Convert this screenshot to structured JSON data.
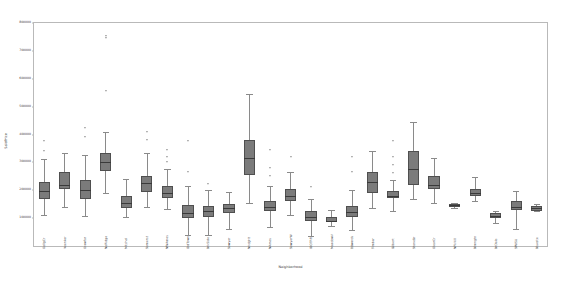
{
  "chart_data": {
    "type": "box",
    "title": "",
    "xlabel": "Neighborhood",
    "ylabel": "SalePrice",
    "ylim": [
      0,
      800000
    ],
    "ytick_labels": [
      "100000",
      "200000",
      "300000",
      "400000",
      "500000",
      "600000",
      "700000",
      "800000"
    ],
    "ytick_values": [
      100000,
      200000,
      300000,
      400000,
      500000,
      600000,
      700000,
      800000
    ],
    "grid": false,
    "legend": false,
    "box_fill_color": "#7b7b7b",
    "median_color": "#3a3a3a",
    "whisker_color": "#8a8a8a",
    "flier_color": "#4a4a4a",
    "categories": [
      "CollgCr",
      "Veenker",
      "Crawfor",
      "NoRidge",
      "Mitchel",
      "Somerst",
      "NWAmes",
      "OldTown",
      "BrkSide",
      "Sawyer",
      "NridgHt",
      "NAmes",
      "SawyerW",
      "IDOTRR",
      "MeadowV",
      "Edwards",
      "Timber",
      "Gilbert",
      "StoneBr",
      "ClearCr",
      "NPkVill",
      "Blmngtn",
      "BrDale",
      "SWISU",
      "Blueste"
    ],
    "boxes": [
      {
        "name": "CollgCr",
        "q1": 170000,
        "median": 197200,
        "q3": 228000,
        "whisker_low": 110000,
        "whisker_high": 312000,
        "fliers": [
          340000,
          375000
        ]
      },
      {
        "name": "Veenker",
        "q1": 205000,
        "median": 218000,
        "q3": 265000,
        "whisker_low": 139000,
        "whisker_high": 335000,
        "fliers": []
      },
      {
        "name": "Crawfor",
        "q1": 168000,
        "median": 200600,
        "q3": 238000,
        "whisker_low": 107000,
        "whisker_high": 325000,
        "fliers": [
          392500,
          422000
        ]
      },
      {
        "name": "NoRidge",
        "q1": 270000,
        "median": 301500,
        "q3": 335000,
        "whisker_low": 190000,
        "whisker_high": 410000,
        "fliers": [
          555000,
          745000,
          755000
        ]
      },
      {
        "name": "Mitchel",
        "q1": 135000,
        "median": 153500,
        "q3": 180000,
        "whisker_low": 104000,
        "whisker_high": 240000,
        "fliers": []
      },
      {
        "name": "Somerst",
        "q1": 192000,
        "median": 225500,
        "q3": 250000,
        "whisker_low": 139000,
        "whisker_high": 335000,
        "fliers": [
          380000,
          410000
        ]
      },
      {
        "name": "NWAmes",
        "q1": 172000,
        "median": 190000,
        "q3": 215000,
        "whisker_low": 132000,
        "whisker_high": 278000,
        "fliers": [
          300000,
          320000,
          345000
        ]
      },
      {
        "name": "OldTown",
        "q1": 100000,
        "median": 119000,
        "q3": 147000,
        "whisker_low": 40000,
        "whisker_high": 215000,
        "fliers": [
          265000,
          375000
        ]
      },
      {
        "name": "BrkSide",
        "q1": 105000,
        "median": 124300,
        "q3": 145000,
        "whisker_low": 40000,
        "whisker_high": 200000,
        "fliers": [
          224000
        ]
      },
      {
        "name": "Sawyer",
        "q1": 120000,
        "median": 135000,
        "q3": 150000,
        "whisker_low": 62000,
        "whisker_high": 192000,
        "fliers": []
      },
      {
        "name": "NridgHt",
        "q1": 255000,
        "median": 315000,
        "q3": 380000,
        "whisker_low": 155000,
        "whisker_high": 545000,
        "fliers": []
      },
      {
        "name": "NAmes",
        "q1": 125000,
        "median": 140000,
        "q3": 162000,
        "whisker_low": 68000,
        "whisker_high": 215000,
        "fliers": [
          252000,
          280000,
          345000
        ]
      },
      {
        "name": "SawyerW",
        "q1": 160000,
        "median": 179900,
        "q3": 205000,
        "whisker_low": 110000,
        "whisker_high": 265000,
        "fliers": [
          320000
        ]
      },
      {
        "name": "IDOTRR",
        "q1": 88000,
        "median": 103000,
        "q3": 125000,
        "whisker_low": 34900,
        "whisker_high": 170000,
        "fliers": [
          212000
        ]
      },
      {
        "name": "MeadowV",
        "q1": 85000,
        "median": 88000,
        "q3": 105000,
        "whisker_low": 73000,
        "whisker_high": 130000,
        "fliers": []
      },
      {
        "name": "Edwards",
        "q1": 103000,
        "median": 121750,
        "q3": 145000,
        "whisker_low": 58500,
        "whisker_high": 200000,
        "fliers": [
          265000,
          320000
        ]
      },
      {
        "name": "Timber",
        "q1": 190000,
        "median": 228475,
        "q3": 265000,
        "whisker_low": 138000,
        "whisker_high": 340000,
        "fliers": []
      },
      {
        "name": "Gilbert",
        "q1": 172000,
        "median": 181000,
        "q3": 198000,
        "whisker_low": 125000,
        "whisker_high": 238000,
        "fliers": [
          262000,
          290000,
          320000,
          377500
        ]
      },
      {
        "name": "StoneBr",
        "q1": 220000,
        "median": 278000,
        "q3": 340000,
        "whisker_low": 170000,
        "whisker_high": 445000,
        "fliers": []
      },
      {
        "name": "ClearCr",
        "q1": 205000,
        "median": 220000,
        "q3": 250000,
        "whisker_low": 155000,
        "whisker_high": 315000,
        "fliers": []
      },
      {
        "name": "NPkVill",
        "q1": 140000,
        "median": 146000,
        "q3": 152000,
        "whisker_low": 135000,
        "whisker_high": 155000,
        "fliers": []
      },
      {
        "name": "Blmngtn",
        "q1": 180000,
        "median": 191000,
        "q3": 203000,
        "whisker_low": 159900,
        "whisker_high": 246000,
        "fliers": []
      },
      {
        "name": "BrDale",
        "q1": 100000,
        "median": 106000,
        "q3": 120000,
        "whisker_low": 83000,
        "whisker_high": 125500,
        "fliers": []
      },
      {
        "name": "SWISU",
        "q1": 130000,
        "median": 139500,
        "q3": 160000,
        "whisker_low": 60000,
        "whisker_high": 197000,
        "fliers": []
      },
      {
        "name": "Blueste",
        "q1": 124000,
        "median": 137500,
        "q3": 145000,
        "whisker_low": 124000,
        "whisker_high": 151000,
        "fliers": []
      }
    ]
  }
}
